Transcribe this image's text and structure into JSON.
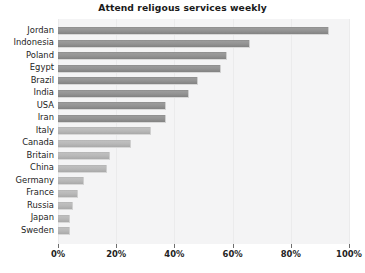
{
  "chart_data": {
    "type": "bar",
    "orientation": "horizontal",
    "title": "Attend religous services weekly",
    "xlabel": "",
    "ylabel": "",
    "xlim": [
      0,
      100
    ],
    "xticks": [
      0,
      20,
      40,
      60,
      80,
      100
    ],
    "xtick_labels": [
      "0%",
      "20%",
      "40%",
      "60%",
      "80%",
      "100%"
    ],
    "grid": true,
    "legend": null,
    "categories": [
      "Jordan",
      "Indonesia",
      "Poland",
      "Egypt",
      "Brazil",
      "India",
      "USA",
      "Iran",
      "Italy",
      "Canada",
      "Britain",
      "China",
      "Germany",
      "France",
      "Russia",
      "Japan",
      "Sweden"
    ],
    "values": [
      93,
      66,
      58,
      56,
      48,
      45,
      37,
      37,
      32,
      25,
      18,
      17,
      9,
      7,
      5,
      4,
      4
    ],
    "bar_color": "#939393",
    "bar_color_light": "#b8b8b8",
    "plot_background": "#f4f4f5",
    "figure_background": "#ffffff",
    "text_color": "#232323"
  }
}
